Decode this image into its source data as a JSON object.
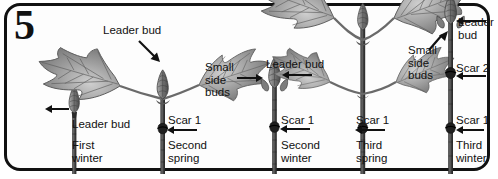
{
  "figure": {
    "plate_number": "5",
    "frame_color": "#111111",
    "background_color": "#fdfdfd",
    "foliage_color": "#8d8d8d",
    "stem_color": "#4a4a4a"
  },
  "stages": [
    {
      "id": "first-winter",
      "season_label": "First\nwinter",
      "leader_bud_label": "Leader bud",
      "has_leaves": false,
      "scars": []
    },
    {
      "id": "second-spring",
      "season_label": "Second\nspring",
      "leader_bud_label": "Leader bud",
      "has_leaves": true,
      "scars": [
        "Scar 1"
      ]
    },
    {
      "id": "second-winter",
      "season_label": "Second\nwinter",
      "leader_bud_label": "Leader bud",
      "small_side_buds_label": "Small\nside\nbuds",
      "has_leaves": false,
      "scars": [
        "Scar 1"
      ]
    },
    {
      "id": "third-spring",
      "season_label": "Third\nspring",
      "has_leaves": true,
      "scars": [
        "Scar 1"
      ]
    },
    {
      "id": "third-winter",
      "season_label": "Third\nwinter",
      "leader_bud_label": "Leader\nbud",
      "small_side_buds_label": "Small\nside\nbuds",
      "has_leaves": false,
      "scars": [
        "Scar 2",
        "Scar 1"
      ]
    }
  ],
  "labels": {
    "leader_bud_1": "Leader bud",
    "leader_bud_2": "Leader bud",
    "leader_bud_3": "Leader bud",
    "leader_bud_5": "Leader\nbud",
    "small_side_buds_3": "Small\nside\nbuds",
    "small_side_buds_5": "Small\nside\nbuds",
    "scar1_stage2": "Scar 1",
    "scar1_stage3": "Scar 1",
    "scar1_stage4": "Scar 1",
    "scar2_stage5": "Scar 2",
    "scar1_stage5": "Scar 1",
    "season_1": "First\nwinter",
    "season_2": "Second\nspring",
    "season_3": "Second\nwinter",
    "season_4": "Third\nspring",
    "season_5": "Third\nwinter"
  }
}
